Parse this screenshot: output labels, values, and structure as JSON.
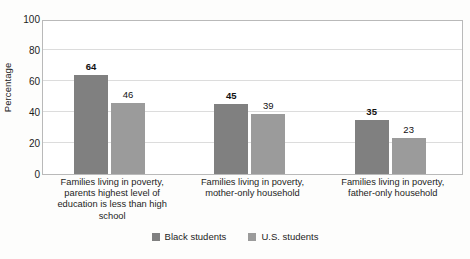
{
  "chart_data": {
    "type": "bar",
    "title": "",
    "subtitle": "",
    "xlabel": "",
    "ylabel": "Percentage",
    "ylim": [
      0,
      100
    ],
    "yticks": [
      0,
      20,
      40,
      60,
      80,
      100
    ],
    "grid": "horizontal",
    "legend_position": "bottom-center",
    "categories": [
      "Families living in poverty, parents highest level of education is less than high school",
      "Families living in poverty, mother-only household",
      "Families living in poverty, father-only household"
    ],
    "category_lines": [
      [
        "Families living in poverty,",
        "parents highest level of",
        "education is less than high",
        "school"
      ],
      [
        "Families living in poverty,",
        "mother-only household"
      ],
      [
        "Families living in poverty,",
        "father-only household"
      ]
    ],
    "series": [
      {
        "name": "Black students",
        "color": "#808080",
        "label_bold": true,
        "values": [
          64,
          46,
          35
        ],
        "value_labels": [
          "64",
          "46",
          "35"
        ]
      },
      {
        "name": "U.S. students",
        "color": "#9b9b9b",
        "label_bold": false,
        "values": [
          46,
          39,
          23
        ],
        "value_labels": [
          "46",
          "39",
          "23"
        ]
      }
    ],
    "bars": [
      {
        "group": 0,
        "series": 0,
        "value": 64,
        "label": "64",
        "bold": true,
        "color": "#808080"
      },
      {
        "group": 0,
        "series": 1,
        "value": 46,
        "label": "46",
        "bold": false,
        "color": "#9b9b9b"
      },
      {
        "group": 1,
        "series": 0,
        "value": 45,
        "label": "45",
        "bold": true,
        "color": "#808080"
      },
      {
        "group": 1,
        "series": 1,
        "value": 39,
        "label": "39",
        "bold": false,
        "color": "#9b9b9b"
      },
      {
        "group": 2,
        "series": 0,
        "value": 35,
        "label": "35",
        "bold": true,
        "color": "#808080"
      },
      {
        "group": 2,
        "series": 1,
        "value": 23,
        "label": "23",
        "bold": false,
        "color": "#9b9b9b"
      }
    ]
  },
  "legend": {
    "items": [
      {
        "label": "Black students",
        "color": "#808080"
      },
      {
        "label": "U.S. students",
        "color": "#9b9b9b"
      }
    ]
  },
  "axes": {
    "y_title": "Percentage",
    "y_tick_labels": [
      "100",
      "80",
      "60",
      "40",
      "20",
      "0"
    ],
    "frame_color": "#b9b9b9",
    "grid_color": "#dcdcdc"
  }
}
